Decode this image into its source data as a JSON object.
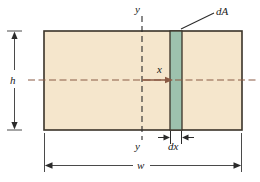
{
  "figure": {
    "name": "rectangular-cross-section-differential-area",
    "labels": {
      "y_top": "y",
      "y_bottom": "y",
      "height": "h",
      "width": "w",
      "x_distance": "x",
      "strip_width": "dx",
      "differential_area": "dA"
    },
    "colors": {
      "section_fill": "#f5e6cc",
      "section_border": "#3a3328",
      "strip_fill": "#9dc2ae",
      "strip_border": "#3a3328",
      "axis_line": "#8a5a44",
      "dimension_line": "#4a4a4a",
      "leader_line": "#3a3328",
      "background": "#ffffff"
    },
    "geometry": {
      "rect_left": 44,
      "rect_right": 242,
      "rect_top": 31,
      "rect_bottom": 130,
      "centerline_y": 80,
      "y_axis_x": 142,
      "strip_left": 170,
      "strip_right": 182
    }
  }
}
